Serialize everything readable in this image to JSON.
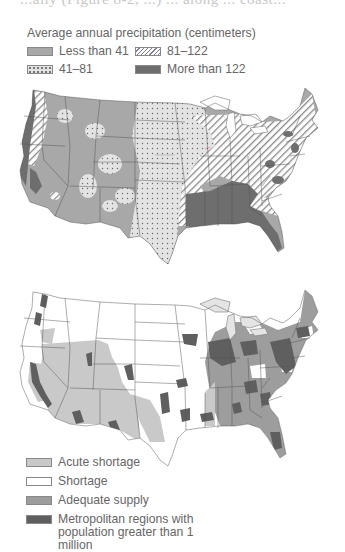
{
  "clipped_header": "...ally (Figure 8-2, ...) ... along ... coast...",
  "precipitation_map": {
    "legend_title": "Average annual precipitation (centimeters)",
    "legend_items": [
      {
        "label": "Less than 41",
        "pattern": "solid-medium-gray",
        "color": "#a8a8a8"
      },
      {
        "label": "81–122",
        "pattern": "diagonal-hatch",
        "color": "#7a7ab0"
      },
      {
        "label": "41–81",
        "pattern": "dotted-light-gray",
        "color": "#e2e2e2"
      },
      {
        "label": "More than 122",
        "pattern": "solid-dark-gray",
        "color": "#6e6e6e"
      }
    ],
    "regions_summary": {
      "west_interior": "Less than 41",
      "great_plains_texas_upper_midwest": "41–81",
      "east_midwest_northeast": "81–122",
      "southeast_gulf_pacific_northwest_coast": "More than 122"
    }
  },
  "water_supply_map": {
    "legend_items": [
      {
        "label": "Acute shortage",
        "color": "#c9c9c9"
      },
      {
        "label": "Shortage",
        "color": "#ffffff"
      },
      {
        "label": "Adequate supply",
        "color": "#9d9d9d"
      },
      {
        "label": "Metropolitan regions with population greater than 1 million",
        "color": "#5f5f5f"
      }
    ],
    "regions_summary": {
      "southwest_california_great_basin": "Acute shortage",
      "plains_midwest_northwest": "Shortage",
      "east_southeast_new_england": "Adequate supply"
    }
  }
}
